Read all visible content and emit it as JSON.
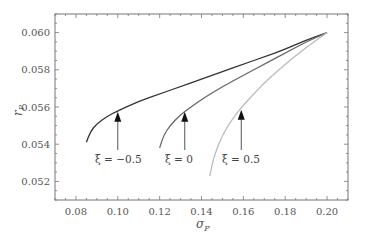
{
  "chart_data": {
    "type": "line",
    "title": "",
    "xlabel": "σ_p",
    "ylabel": "r_p",
    "xlim": [
      0.07,
      0.21
    ],
    "ylim": [
      0.051,
      0.061
    ],
    "xticks": [
      "0.08",
      "0.10",
      "0.12",
      "0.14",
      "0.16",
      "0.18",
      "0.20"
    ],
    "yticks": [
      "0.052",
      "0.054",
      "0.056",
      "0.058",
      "0.060"
    ],
    "grid": false,
    "legend": "none (curves annotated with arrows)",
    "series": [
      {
        "name": "ξ = −0.5",
        "color": "#333333",
        "x": [
          0.085,
          0.087,
          0.09,
          0.095,
          0.1,
          0.11,
          0.12,
          0.13,
          0.14,
          0.15,
          0.16,
          0.17,
          0.18,
          0.19,
          0.2
        ],
        "y": [
          0.0541,
          0.0547,
          0.0551,
          0.0555,
          0.0558,
          0.0563,
          0.0567,
          0.0571,
          0.0575,
          0.0579,
          0.0583,
          0.0587,
          0.0591,
          0.0596,
          0.06
        ]
      },
      {
        "name": "ξ = 0",
        "color": "#666666",
        "x": [
          0.12,
          0.122,
          0.125,
          0.13,
          0.135,
          0.14,
          0.15,
          0.16,
          0.17,
          0.18,
          0.19,
          0.2
        ],
        "y": [
          0.0538,
          0.0545,
          0.055,
          0.0556,
          0.056,
          0.0564,
          0.0571,
          0.0577,
          0.0583,
          0.0589,
          0.0595,
          0.06
        ]
      },
      {
        "name": "ξ = 0.5",
        "color": "#bbbbbb",
        "x": [
          0.144,
          0.146,
          0.15,
          0.155,
          0.16,
          0.165,
          0.17,
          0.18,
          0.19,
          0.2
        ],
        "y": [
          0.0523,
          0.0534,
          0.0545,
          0.0554,
          0.0561,
          0.0567,
          0.0573,
          0.0583,
          0.0592,
          0.06
        ]
      }
    ],
    "annotations": [
      {
        "text": "ξ = −0.5",
        "arrow_x": 0.1,
        "arrow_tip_y": 0.0558
      },
      {
        "text": "ξ = 0",
        "arrow_x": 0.132,
        "arrow_tip_y": 0.0558
      },
      {
        "text": "ξ = 0.5",
        "arrow_x": 0.159,
        "arrow_tip_y": 0.0559
      }
    ]
  },
  "labels": {
    "ylabel_main": "r",
    "ylabel_sub": "P",
    "xlabel_main": "σ",
    "xlabel_sub": "P",
    "ann0": "ξ = −0.5",
    "ann1": "ξ = 0",
    "ann2": "ξ = 0.5"
  }
}
